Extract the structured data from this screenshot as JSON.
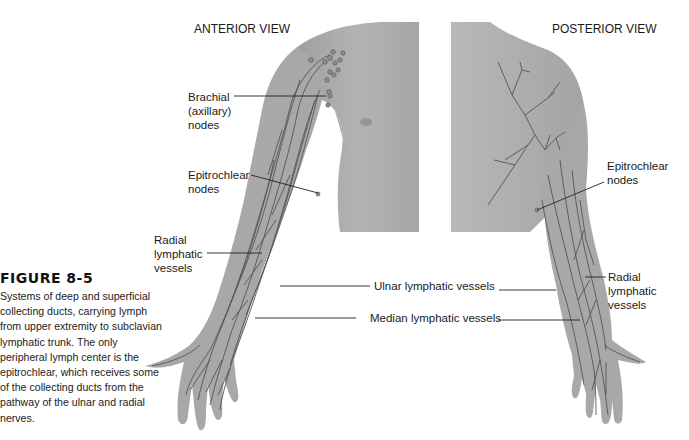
{
  "views": {
    "anterior": {
      "title": "ANTERIOR VIEW"
    },
    "posterior": {
      "title": "POSTERIOR VIEW"
    }
  },
  "labels": {
    "brachial_nodes": [
      "Brachial",
      "(axillary)",
      "nodes"
    ],
    "epitrochlear_anterior": [
      "Epitrochlear",
      "nodes"
    ],
    "radial_anterior": [
      "Radial",
      "lymphatic",
      "vessels"
    ],
    "ulnar": "Ulnar lymphatic vessels",
    "median": "Median lymphatic vessels",
    "epitrochlear_posterior": [
      "Epitrochlear",
      "nodes"
    ],
    "radial_posterior": [
      "Radial",
      "lymphatic",
      "vessels"
    ]
  },
  "caption": {
    "title": "FIGURE 8-5",
    "body": "Systems of deep and superficial collecting ducts, carrying lymph from upper extremity to subclavian lymphatic trunk. The only peripheral lymph center is the epitrochlear, which receives some of the collecting ducts from the pathway of the ulnar and radial nerves."
  },
  "colors": {
    "skin": "#a9a9a9",
    "skin_light": "#bdbdbd",
    "vessel": "#4a4a4a",
    "node": "#8a8a8a",
    "leader_line": "#222222"
  }
}
